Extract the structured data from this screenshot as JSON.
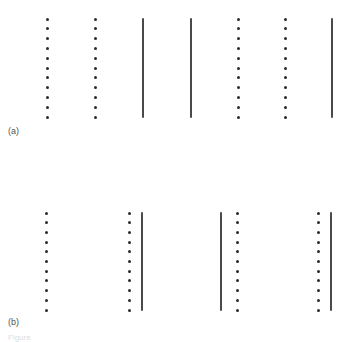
{
  "panels": [
    {
      "label": "(a)",
      "top": 19,
      "bottom": 117,
      "label_pos": [
        8,
        126
      ],
      "dot_columns": [
        47,
        95,
        238,
        285
      ],
      "lines": [
        143,
        191,
        332
      ],
      "dots_per_column": 11
    },
    {
      "label": "(b)",
      "top": 213,
      "bottom": 310,
      "label_pos": [
        8,
        317
      ],
      "dot_columns": [
        46,
        129,
        237,
        318
      ],
      "lines": [
        142,
        221,
        331
      ],
      "dots_per_column": 11
    }
  ],
  "caption": "Figure"
}
